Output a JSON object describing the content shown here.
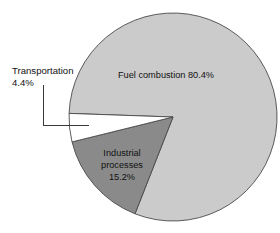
{
  "chart_data": {
    "type": "pie",
    "title": "",
    "subtitle": "",
    "xlabel": "",
    "ylabel": "",
    "legend_position": "none",
    "grid": false,
    "total": 100.0,
    "units": "percent",
    "categories": [
      "Fuel combustion",
      "Industrial processes",
      "Transportation"
    ],
    "values": [
      80.4,
      15.2,
      4.4
    ],
    "slices": [
      {
        "name": "Fuel combustion",
        "value": 80.4,
        "label_text": "Fuel combustion 80.4%",
        "label_lines": [
          "Fuel combustion 80.4%"
        ],
        "color": "#cbcbcb",
        "label_placement": "inside",
        "callout": false
      },
      {
        "name": "Industrial processes",
        "value": 15.2,
        "label_text": "Industrial processes 15.2%",
        "label_lines": [
          "Industrial",
          "processes",
          "15.2%"
        ],
        "color": "#8a8a8a",
        "label_placement": "inside",
        "callout": false
      },
      {
        "name": "Transportation",
        "value": 4.4,
        "label_text": "Transportation 4.4%",
        "label_lines": [
          "Transportation",
          "4.4%"
        ],
        "color": "#ffffff",
        "label_placement": "outside-left",
        "callout": true
      }
    ],
    "annotations": [
      {
        "name": "transportation-callout",
        "lines": [
          "Transportation",
          "4.4%"
        ],
        "points_to": "Transportation"
      }
    ],
    "axis_ranges": null,
    "tick_labels": []
  },
  "chart": {
    "labels": {
      "fuel_combustion": "Fuel combustion 80.4%",
      "industrial_line1": "Industrial",
      "industrial_line2": "processes",
      "industrial_line3": "15.2%",
      "transportation_line1": "Transportation",
      "transportation_line2": "4.4%"
    },
    "colors": {
      "fuel_combustion": "#cbcbcb",
      "industrial_processes": "#8a8a8a",
      "transportation": "#ffffff",
      "outline": "#4a4a4a",
      "leader_line": "#3a3a3a",
      "background": "#ffffff",
      "text": "#111111"
    },
    "geometry": {
      "center_x": 173,
      "center_y": 117,
      "radius": 104
    }
  }
}
